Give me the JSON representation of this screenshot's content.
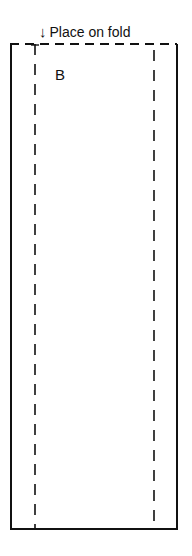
{
  "pattern_piece": {
    "fold_label": "Place on fold",
    "fold_arrow_icon": "↓",
    "piece_letter": "B"
  },
  "colors": {
    "line": "#111111",
    "background": "#ffffff"
  }
}
